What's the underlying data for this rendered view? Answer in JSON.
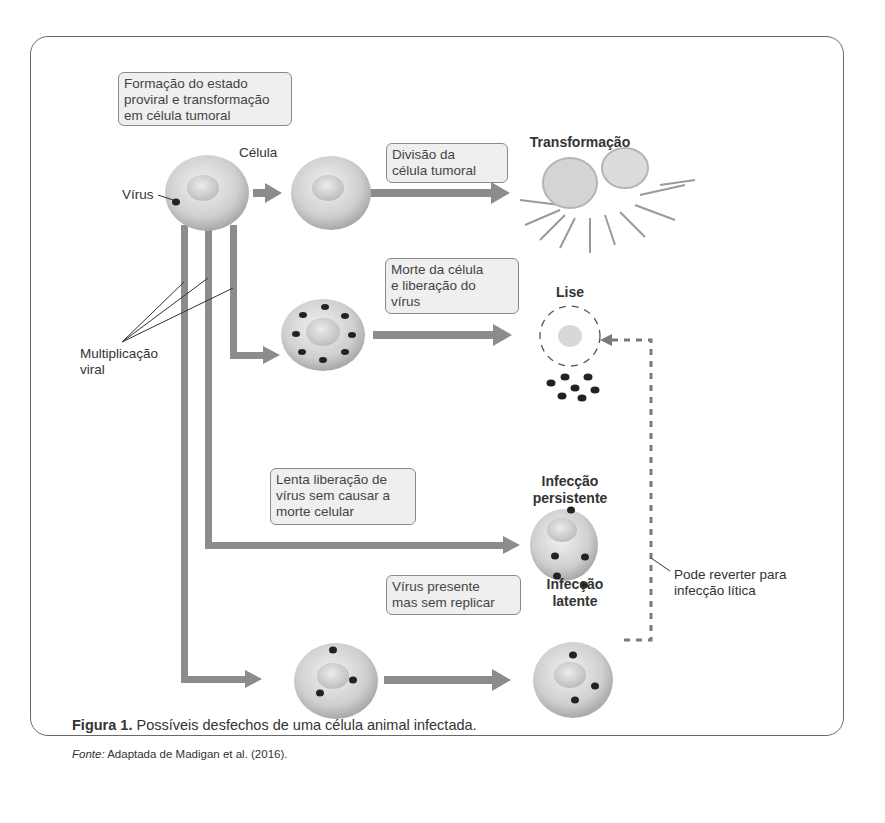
{
  "figure": {
    "boxes": {
      "proviral": "Formação do estado\nproviral e transformação\nem célula tumoral",
      "division": "Divisão da\ncélula tumoral",
      "death": "Morte da célula\ne liberação do\nvírus",
      "slow_release": "Lenta liberação de\nvírus sem causar a\nmorte celular",
      "present": "Vírus presente\nmas sem replicar"
    },
    "labels": {
      "cell": "Célula",
      "virus": "Vírus",
      "multiplication": "Multiplicação\nviral",
      "revert": "Pode reverter para\ninfecção lítica"
    },
    "outcomes": {
      "transformation": "Transformação",
      "lysis": "Lise",
      "persistent": "Infecção\npersistente",
      "latent": "Infecção\nlatente"
    },
    "colors": {
      "arrow": "#8c8c8c",
      "box_fill": "#efefef",
      "box_border": "#8a8a8a",
      "cell": "#d9d9d9",
      "virus": "#222222"
    }
  },
  "caption": {
    "label": "Figura 1.",
    "text": " Possíveis desfechos de uma célula animal infectada."
  },
  "source": {
    "label": "Fonte:",
    "text": " Adaptada de Madigan et al. (2016)."
  }
}
